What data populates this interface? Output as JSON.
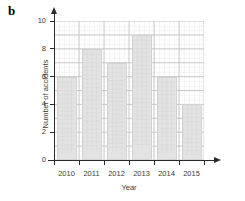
{
  "figure": {
    "part_label": "b",
    "background_color": "#ffffff",
    "bar_color": "#e3e3e3",
    "grid_color": "#d9d9d9",
    "grid_major_color": "#bdbdbd",
    "axis_color": "#2b2b2b",
    "text_color": "#3a3a3a"
  },
  "chart_data": {
    "type": "bar",
    "title": "",
    "xlabel": "Year",
    "ylabel": "Number of accidents",
    "categories": [
      "2010",
      "2011",
      "2012",
      "2013",
      "2014",
      "2015"
    ],
    "values": [
      6,
      8,
      7,
      9,
      6,
      4
    ],
    "ylim": [
      0,
      10
    ],
    "yticks": [
      "0",
      "2",
      "4",
      "6",
      "8",
      "10"
    ],
    "ytick_values": [
      0,
      2,
      4,
      6,
      8,
      10
    ],
    "xlim_categories": 6,
    "grid": "graph-paper minor grid with major lines every 1 unit vertically and every half category horizontally",
    "legend": "none",
    "legend_position": "none",
    "series": [
      {
        "name": "Number of accidents",
        "values": [
          6,
          8,
          7,
          9,
          6,
          4
        ]
      }
    ],
    "points": [
      {
        "category": "2010",
        "value": 6
      },
      {
        "category": "2011",
        "value": 8
      },
      {
        "category": "2012",
        "value": 7
      },
      {
        "category": "2013",
        "value": 9
      },
      {
        "category": "2014",
        "value": 6
      },
      {
        "category": "2015",
        "value": 4
      }
    ]
  }
}
